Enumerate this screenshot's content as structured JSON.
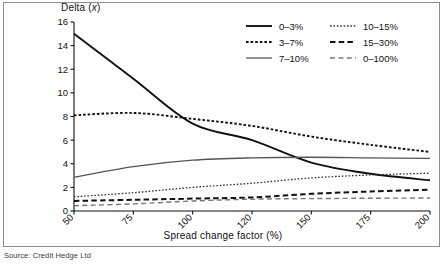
{
  "figure": {
    "source_note": "Source: Credit Hedge Ltd",
    "border_color": "#8d8d8d"
  },
  "chart_data": {
    "type": "line",
    "title": "",
    "ylabel": "Delta (x)",
    "xlabel": "Spread change factor (%)",
    "categories": [
      "50",
      "75",
      "100",
      "120",
      "150",
      "175",
      "200"
    ],
    "x": [
      50,
      75,
      100,
      120,
      150,
      175,
      200
    ],
    "ylim": [
      0,
      16
    ],
    "yticks": [
      0,
      2,
      4,
      6,
      8,
      10,
      12,
      14,
      16
    ],
    "grid": false,
    "legend_position": "top-right",
    "xtick_rotation": 45,
    "series": [
      {
        "name": "0–3%",
        "values": [
          15.0,
          11.2,
          7.4,
          6.0,
          4.1,
          3.15,
          2.6
        ],
        "color": "#111111",
        "style": "solid",
        "width": 1.9
      },
      {
        "name": "3–7%",
        "values": [
          8.1,
          8.3,
          7.8,
          7.2,
          6.3,
          5.6,
          5.0
        ],
        "color": "#111111",
        "style": "dotted",
        "width": 1.9
      },
      {
        "name": "7–10%",
        "values": [
          2.85,
          3.75,
          4.3,
          4.5,
          4.55,
          4.5,
          4.45
        ],
        "color": "#555555",
        "style": "solid",
        "width": 1.3
      },
      {
        "name": "10–15%",
        "values": [
          1.2,
          1.55,
          2.0,
          2.35,
          2.8,
          3.05,
          3.2
        ],
        "color": "#333333",
        "style": "fine-dotted",
        "width": 1.3
      },
      {
        "name": "15–30%",
        "values": [
          0.85,
          0.95,
          1.05,
          1.15,
          1.45,
          1.65,
          1.8
        ],
        "color": "#111111",
        "style": "dashed",
        "width": 2.0
      },
      {
        "name": "0–100%",
        "values": [
          0.45,
          0.6,
          0.85,
          1.0,
          1.05,
          1.08,
          1.1
        ],
        "color": "#777777",
        "style": "dashed-thin",
        "width": 1.4
      }
    ]
  },
  "legend": {
    "columns": [
      [
        "0–3%",
        "3–7%",
        "7–10%"
      ],
      [
        "10–15%",
        "15–30%",
        "0–100%"
      ]
    ]
  }
}
